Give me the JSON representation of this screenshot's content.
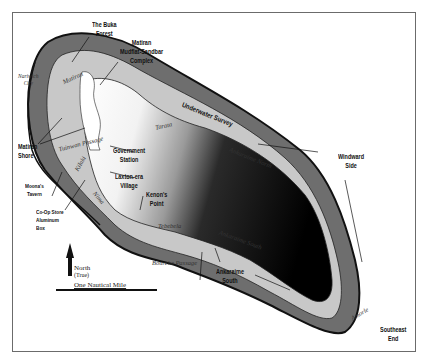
{
  "map": {
    "title": "",
    "feature_labels": {
      "buka_forest": "The Buka\nForest",
      "mudflat_complex": "Matiran\nMudflat-Sandbar\nComplex",
      "underwater_survey": "Underwater Survey",
      "windward_side": "Windward\nSide",
      "matiran_shore": "Matiran\nShore",
      "government_station": "Government\nStation",
      "laxton_village": "Laxton-era\nVillage",
      "kenons_point": "Kenon's\nPoint",
      "moonas_tavern": "Moona's\nTavern",
      "coop_store": "Co-Op Store\nAluminum\nBox",
      "ankaraime_south": "Ankaraime\nSouth",
      "southeast_end": "Southeast\nEnd"
    },
    "region_labels": {
      "nariwich_city": "Nariwich\nCity",
      "matiran": "Matiran",
      "tarata": "Tarata",
      "tuinwan_passage": "Tuinwan Passage",
      "kilaki": "Kilaki",
      "nima": "Nima",
      "tebebela": "Tebebela",
      "ankaraime_north": "Ankaraime North",
      "ankaraime_south_region": "Ankaraime South",
      "bourche_passage": "Bourche Passage",
      "amorle": "Amorle"
    },
    "legend": {
      "north_label": "North",
      "north_sub": "(True)",
      "scale_label": "One Nautical Mile"
    },
    "colors": {
      "reef": "#6e6e6e",
      "land": "#c8c8c8",
      "lagoon_light": "#ffffff",
      "lagoon_dark": "#000000",
      "outline": "#111111",
      "frame": "#6b6b6b"
    }
  }
}
